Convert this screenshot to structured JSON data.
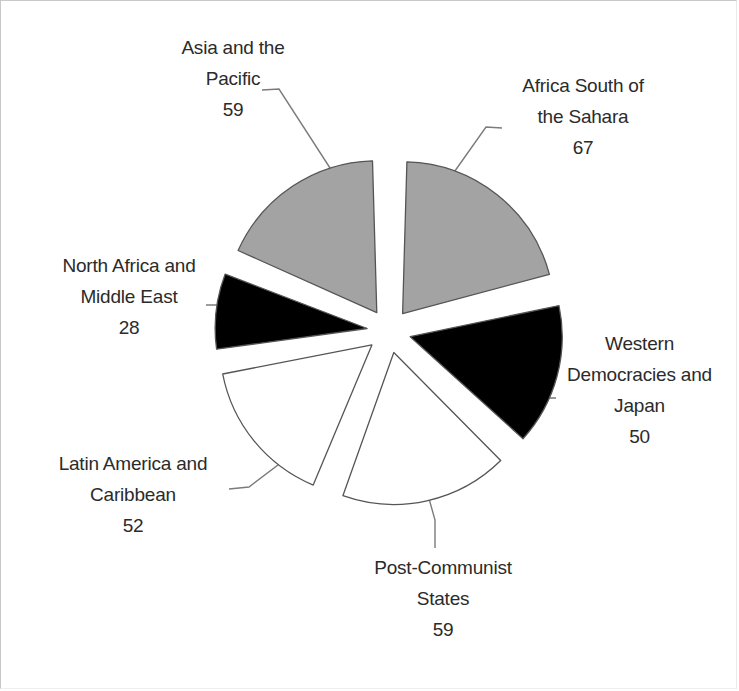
{
  "chart_data": {
    "type": "pie",
    "title": "",
    "subtitle": "",
    "xlabel": "",
    "ylabel": "",
    "exploded": true,
    "legend_position": "none",
    "labels_show_value": true,
    "total": 315,
    "categories": [
      "Africa South of the Sahara",
      "Western Democracies and Japan",
      "Post-Communist States",
      "Latin America and Caribbean",
      "North Africa and Middle East",
      "Asia and the Pacific"
    ],
    "values": [
      67,
      50,
      59,
      52,
      28,
      59
    ],
    "slice_fills": [
      "#a3a3a3",
      "#000000",
      "#ffffff",
      "#ffffff",
      "#000000",
      "#a3a3a3"
    ],
    "slice_stroke": "#555555",
    "slices": [
      {
        "name": "Africa South of the Sahara",
        "label_line1": "Africa South of",
        "label_line2": "the Sahara",
        "value": 67,
        "fill": "#a3a3a3"
      },
      {
        "name": "Western Democracies and Japan",
        "label_line1": "Western",
        "label_line2": "Democracies and",
        "label_line3": "Japan",
        "value": 50,
        "fill": "#000000"
      },
      {
        "name": "Post-Communist States",
        "label_line1": "Post-Communist",
        "label_line2": "States",
        "value": 59,
        "fill": "#ffffff"
      },
      {
        "name": "Latin America and Caribbean",
        "label_line1": "Latin America and",
        "label_line2": "Caribbean",
        "value": 52,
        "fill": "#ffffff"
      },
      {
        "name": "North Africa and Middle East",
        "label_line1": "North Africa and",
        "label_line2": "Middle East",
        "value": 28,
        "fill": "#000000"
      },
      {
        "name": "Asia and the Pacific",
        "label_line1": "Asia and the",
        "label_line2": "Pacific",
        "value": 59,
        "fill": "#a3a3a3"
      }
    ]
  }
}
